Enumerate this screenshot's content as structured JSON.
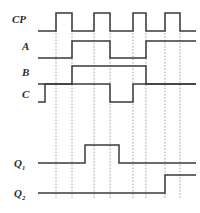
{
  "figure": {
    "type": "digital-timing-diagram",
    "background_color": "#ffffff",
    "trace_color": "#3a3a3a",
    "gridline_color": "#9a9a9a",
    "label_color": "#2b2b2b",
    "caption": ""
  },
  "labels": {
    "cp": "CP",
    "a": "A",
    "b": "B",
    "c": "C",
    "q1_base": "Q",
    "q1_sub": "1",
    "q2_base": "Q",
    "q2_sub": "2"
  },
  "chart_data": {
    "type": "line",
    "title": "",
    "xlabel": "",
    "ylabel": "",
    "grid": true,
    "legend_position": "left-axis-labels",
    "xlim": [
      38,
      196
    ],
    "gridlines_x": [
      56,
      72,
      94,
      110,
      133,
      146,
      165,
      180
    ],
    "signals": [
      {
        "name": "CP",
        "label": "CP",
        "y_low": 31,
        "y_high": 13,
        "edges": [
          {
            "x": 38,
            "level": 0
          },
          {
            "x": 56,
            "level": 1
          },
          {
            "x": 72,
            "level": 0
          },
          {
            "x": 94,
            "level": 1
          },
          {
            "x": 110,
            "level": 0
          },
          {
            "x": 133,
            "level": 1
          },
          {
            "x": 146,
            "level": 0
          },
          {
            "x": 165,
            "level": 1
          },
          {
            "x": 180,
            "level": 0
          },
          {
            "x": 196,
            "level": 0
          }
        ]
      },
      {
        "name": "A",
        "label": "A",
        "y_low": 58,
        "y_high": 41,
        "edges": [
          {
            "x": 38,
            "level": 0
          },
          {
            "x": 72,
            "level": 1
          },
          {
            "x": 110,
            "level": 0
          },
          {
            "x": 146,
            "level": 1
          },
          {
            "x": 196,
            "level": 1
          }
        ]
      },
      {
        "name": "B",
        "label": "B",
        "y_low": 84,
        "y_high": 66,
        "edges": [
          {
            "x": 38,
            "level": 0
          },
          {
            "x": 72,
            "level": 1
          },
          {
            "x": 146,
            "level": 0
          },
          {
            "x": 196,
            "level": 0
          }
        ]
      },
      {
        "name": "C",
        "label": "C",
        "y_low": 102,
        "y_high": 84,
        "edges": [
          {
            "x": 38,
            "level": 0
          },
          {
            "x": 45,
            "level": 1
          },
          {
            "x": 110,
            "level": 0
          },
          {
            "x": 133,
            "level": 1
          },
          {
            "x": 196,
            "level": 1
          }
        ]
      },
      {
        "name": "Q1",
        "label": "Q1",
        "y_low": 163,
        "y_high": 145,
        "edges": [
          {
            "x": 38,
            "level": 0
          },
          {
            "x": 85,
            "level": 1
          },
          {
            "x": 119,
            "level": 0
          },
          {
            "x": 196,
            "level": 0
          }
        ]
      },
      {
        "name": "Q2",
        "label": "Q2",
        "y_low": 193,
        "y_high": 175,
        "edges": [
          {
            "x": 38,
            "level": 0
          },
          {
            "x": 165,
            "level": 1
          },
          {
            "x": 196,
            "level": 1
          }
        ]
      }
    ]
  }
}
